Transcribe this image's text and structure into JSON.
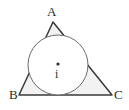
{
  "figure": {
    "background_color": "#ffffff",
    "stroke_color": "#3a3a3a",
    "fill_color": "#f2f2f2",
    "circle_fill_color": "#ffffff",
    "labels": {
      "vertex_a": "A",
      "vertex_b": "B",
      "vertex_c": "C",
      "incenter": "i"
    },
    "geometry": {
      "triangle": {
        "a": {
          "x": 53,
          "y": 22
        },
        "b": {
          "x": 19,
          "y": 95
        },
        "c": {
          "x": 112,
          "y": 95
        },
        "points": "53,22 19,95 112,95"
      },
      "incircle": {
        "cx": 58,
        "cy": 65,
        "r": 30
      },
      "incenter_point": {
        "cx": 58,
        "cy": 64,
        "r": 1.6
      }
    }
  }
}
